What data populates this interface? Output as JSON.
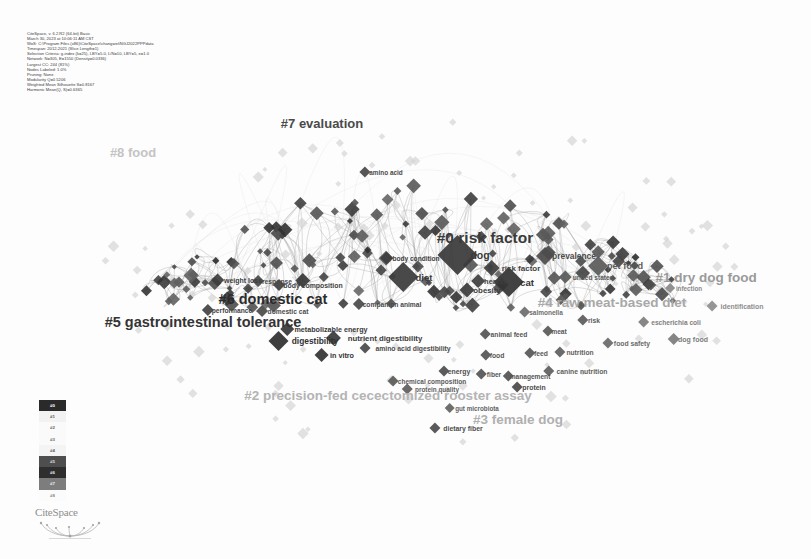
{
  "app": {
    "name": "CiteSpace",
    "logo_wordmark": "CiteSpace"
  },
  "metadata": {
    "lines": [
      "CiteSpace, v. 6.2.R2 (64-bit) Basic",
      "March 30, 2023 at 10:06:11 AM CST",
      "WoS: C:\\Program Files (x86)\\CiteSpace\\changwei\\NGJ2022PPPdata",
      "Timespan: 2012-2021 (Slice Length=1)",
      "Selection Criteria: g-index (k=25), LBY=5.0, L/N=10, LBY=5, e=1.0",
      "Network: N=305, E=1550 (Density=0.0336)",
      "Largest CC: 244 (81%)",
      "Nodes Labeled: 1.0%",
      "Pruning: None",
      "Modularity Q=0.5206",
      "Weighted Mean Silhouette S=0.8167",
      "Harmonic Mean(Q, S)=0.6365"
    ]
  },
  "legend": {
    "title": "cluster-legend",
    "items": [
      {
        "id": "#0",
        "color": "#2a2a2a",
        "text_color": "#ffffff"
      },
      {
        "id": "#1",
        "color": "#f2f2f2",
        "text_color": "#555555"
      },
      {
        "id": "#2",
        "color": "#fafafa",
        "text_color": "#6a6a6a"
      },
      {
        "id": "#3",
        "color": "#fafafa",
        "text_color": "#6a6a6a"
      },
      {
        "id": "#4",
        "color": "#f4f4f4",
        "text_color": "#5f5f5f"
      },
      {
        "id": "#5",
        "color": "#4e4e4e",
        "text_color": "#dcdcdc"
      },
      {
        "id": "#6",
        "color": "#2e2e2e",
        "text_color": "#eaeaea"
      },
      {
        "id": "#7",
        "color": "#7d7d7d",
        "text_color": "#f0f0f0"
      },
      {
        "id": "#8",
        "color": "#fbfbfb",
        "text_color": "#8a8a8a"
      }
    ]
  },
  "chart_data": {
    "type": "scatter",
    "xlabel": "",
    "ylabel": "",
    "grid": false,
    "legend_position": "bottom-left",
    "clusters": [
      {
        "id": "#0",
        "label": "#0 risk factor",
        "x": 485,
        "y": 238,
        "size": 15.5,
        "color": "#3b3b3b"
      },
      {
        "id": "#1",
        "label": "#1 dry dog food",
        "x": 706,
        "y": 277,
        "size": 13.5,
        "color": "#9a9a9a"
      },
      {
        "id": "#2",
        "label": "#2 precision-fed cecectomized rooster assay",
        "x": 388,
        "y": 395,
        "size": 13.5,
        "color": "#b4b4b4"
      },
      {
        "id": "#3",
        "label": "#3 female dog",
        "x": 518,
        "y": 419,
        "size": 13.5,
        "color": "#b0b0b0"
      },
      {
        "id": "#4",
        "label": "#4 raw meat-based diet",
        "x": 612,
        "y": 302,
        "size": 13.5,
        "color": "#a8a8a8"
      },
      {
        "id": "#5",
        "label": "#5 gastrointestinal tolerance",
        "x": 203,
        "y": 322,
        "size": 14.5,
        "color": "#343434"
      },
      {
        "id": "#6",
        "label": "#6 domestic cat",
        "x": 273,
        "y": 299,
        "size": 14.5,
        "color": "#2b2b2b"
      },
      {
        "id": "#7",
        "label": "#7 evaluation",
        "x": 322,
        "y": 123,
        "size": 13.0,
        "color": "#4a4a4a"
      },
      {
        "id": "#8",
        "label": "#8 food",
        "x": 133,
        "y": 152,
        "size": 13.0,
        "color": "#c4c4c4"
      }
    ],
    "nodes": [
      {
        "label": "amino acid",
        "x": 386,
        "y": 172,
        "size": 5.5,
        "fs": 6.4,
        "color": "#4a4a4a"
      },
      {
        "label": "body condition",
        "x": 416,
        "y": 258,
        "size": 6.5,
        "fs": 6.6,
        "color": "#3d3d3d"
      },
      {
        "label": "dog",
        "x": 480,
        "y": 255,
        "size": 20.0,
        "fs": 10.5,
        "color": "#3a3a3a"
      },
      {
        "label": "diet",
        "x": 424,
        "y": 277,
        "size": 15.0,
        "fs": 9.5,
        "color": "#3b3b3b"
      },
      {
        "label": "prevalence",
        "x": 574,
        "y": 256,
        "size": 9.0,
        "fs": 8.4,
        "color": "#4c4c4c"
      },
      {
        "label": "risk factor",
        "x": 521,
        "y": 268,
        "size": 8.0,
        "fs": 8.0,
        "color": "#3f3f3f"
      },
      {
        "label": "health",
        "x": 495,
        "y": 281,
        "size": 7.0,
        "fs": 7.4,
        "color": "#3f3f3f"
      },
      {
        "label": "cat",
        "x": 527,
        "y": 282,
        "size": 15.0,
        "fs": 9.6,
        "color": "#343434"
      },
      {
        "label": "obesity",
        "x": 487,
        "y": 290,
        "size": 7.5,
        "fs": 7.8,
        "color": "#3b3b3b"
      },
      {
        "label": "pet food",
        "x": 625,
        "y": 266,
        "size": 10.0,
        "fs": 9.2,
        "color": "#5b5b5b"
      },
      {
        "label": "united states",
        "x": 593,
        "y": 277,
        "size": 6.5,
        "fs": 6.6,
        "color": "#5a5a5a"
      },
      {
        "label": "companion animal",
        "x": 392,
        "y": 304,
        "size": 6.0,
        "fs": 6.7,
        "color": "#4a4a4a"
      },
      {
        "label": "salmonella",
        "x": 546,
        "y": 312,
        "size": 5.5,
        "fs": 6.5,
        "color": "#6e6e6e"
      },
      {
        "label": "risk",
        "x": 594,
        "y": 320,
        "size": 5.5,
        "fs": 6.8,
        "color": "#5c5c5c"
      },
      {
        "label": "escherichia coli",
        "x": 676,
        "y": 322,
        "size": 5.5,
        "fs": 6.6,
        "color": "#7e7e7e"
      },
      {
        "label": "infection",
        "x": 689,
        "y": 288,
        "size": 5.0,
        "fs": 6.3,
        "color": "#8a8a8a"
      },
      {
        "label": "identification",
        "x": 742,
        "y": 306,
        "size": 5.5,
        "fs": 6.9,
        "color": "#8d8d8d"
      },
      {
        "label": "dog food",
        "x": 693,
        "y": 339,
        "size": 6.0,
        "fs": 7.0,
        "color": "#7c7c7c"
      },
      {
        "label": "food safety",
        "x": 632,
        "y": 343,
        "size": 5.5,
        "fs": 6.8,
        "color": "#6a6a6a"
      },
      {
        "label": "nutrition",
        "x": 580,
        "y": 352,
        "size": 5.5,
        "fs": 6.7,
        "color": "#606060"
      },
      {
        "label": "meat",
        "x": 559,
        "y": 331,
        "size": 5.5,
        "fs": 6.7,
        "color": "#5a5a5a"
      },
      {
        "label": "animal feed",
        "x": 509,
        "y": 334,
        "size": 5.5,
        "fs": 6.7,
        "color": "#565656"
      },
      {
        "label": "feed",
        "x": 541,
        "y": 353,
        "size": 5.5,
        "fs": 6.8,
        "color": "#585858"
      },
      {
        "label": "food",
        "x": 497,
        "y": 355,
        "size": 5.5,
        "fs": 6.8,
        "color": "#555555"
      },
      {
        "label": "canine nutrition",
        "x": 582,
        "y": 371,
        "size": 5.5,
        "fs": 6.8,
        "color": "#5f5f5f"
      },
      {
        "label": "weight loss",
        "x": 243,
        "y": 280,
        "size": 6.5,
        "fs": 7.0,
        "color": "#3d3d3d"
      },
      {
        "label": "response",
        "x": 277,
        "y": 281,
        "size": 6.0,
        "fs": 6.8,
        "color": "#4a4a4a"
      },
      {
        "label": "body composition",
        "x": 313,
        "y": 285,
        "size": 6.0,
        "fs": 6.9,
        "color": "#3f3f3f"
      },
      {
        "label": "performance",
        "x": 232,
        "y": 310,
        "size": 6.0,
        "fs": 6.7,
        "color": "#444444"
      },
      {
        "label": "domestic cat",
        "x": 288,
        "y": 311,
        "size": 6.0,
        "fs": 6.7,
        "color": "#4c4c4c"
      },
      {
        "label": "metabolizable energy",
        "x": 331,
        "y": 329,
        "size": 7.0,
        "fs": 7.2,
        "color": "#3a3a3a"
      },
      {
        "label": "digestibility",
        "x": 315,
        "y": 341,
        "size": 10.0,
        "fs": 8.4,
        "color": "#303030"
      },
      {
        "label": "nutrient digestibility",
        "x": 385,
        "y": 338,
        "size": 7.5,
        "fs": 7.8,
        "color": "#3a3a3a"
      },
      {
        "label": "in vitro",
        "x": 342,
        "y": 355,
        "size": 7.0,
        "fs": 7.2,
        "color": "#343434"
      },
      {
        "label": "amino acid digestibility",
        "x": 413,
        "y": 348,
        "size": 5.5,
        "fs": 6.8,
        "color": "#4a4a4a"
      },
      {
        "label": "energy",
        "x": 459,
        "y": 371,
        "size": 5.5,
        "fs": 6.9,
        "color": "#4f4f4f"
      },
      {
        "label": "fiber",
        "x": 494,
        "y": 374,
        "size": 5.5,
        "fs": 6.6,
        "color": "#555555"
      },
      {
        "label": "management",
        "x": 530,
        "y": 376,
        "size": 5.5,
        "fs": 6.6,
        "color": "#545454"
      },
      {
        "label": "protein",
        "x": 534,
        "y": 387,
        "size": 5.5,
        "fs": 6.9,
        "color": "#4a4a4a"
      },
      {
        "label": "chemical composition",
        "x": 432,
        "y": 381,
        "size": 5.5,
        "fs": 6.5,
        "color": "#5b5b5b"
      },
      {
        "label": "protein quality",
        "x": 437,
        "y": 389,
        "size": 5.5,
        "fs": 6.4,
        "color": "#5f5f5f"
      },
      {
        "label": "gut microbiota",
        "x": 477,
        "y": 408,
        "size": 5.0,
        "fs": 6.3,
        "color": "#636363"
      },
      {
        "label": "dietary fiber",
        "x": 463,
        "y": 428,
        "size": 5.5,
        "fs": 6.9,
        "color": "#4d4d4d"
      }
    ]
  }
}
